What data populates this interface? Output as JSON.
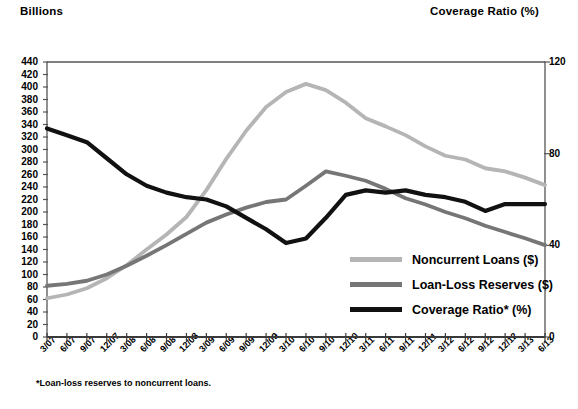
{
  "labels": {
    "left_axis_title": "Billions",
    "right_axis_title": "Coverage Ratio (%)",
    "footnote": "*Loan-loss reserves to noncurrent loans."
  },
  "legend": {
    "items": [
      {
        "label": "Noncurrent Loans ($)",
        "color": "#b5b5b5"
      },
      {
        "label": "Loan-Loss Reserves ($)",
        "color": "#767676"
      },
      {
        "label": "Coverage Ratio* (%)",
        "color": "#111111"
      }
    ]
  },
  "chart_data": {
    "type": "line",
    "title": "",
    "xlabel": "",
    "ylabel": "Billions",
    "y2label": "Coverage Ratio (%)",
    "ylim": [
      0,
      440
    ],
    "y2lim": [
      0,
      120
    ],
    "yticks": [
      0,
      20,
      40,
      60,
      80,
      100,
      120,
      140,
      160,
      180,
      200,
      220,
      240,
      260,
      280,
      300,
      320,
      340,
      360,
      380,
      400,
      420,
      440
    ],
    "y2ticks": [
      0,
      40,
      80,
      120
    ],
    "grid": false,
    "legend_position": "inside-lower-right",
    "categories": [
      "3/07",
      "6/07",
      "9/07",
      "12/07",
      "3/08",
      "6/08",
      "9/08",
      "12/08",
      "3/09",
      "6/09",
      "9/09",
      "12/09",
      "3/10",
      "6/10",
      "9/10",
      "12/10",
      "3/11",
      "6/11",
      "9/11",
      "12/11",
      "3/12",
      "6/12",
      "9/12",
      "12/12",
      "3/13",
      "6/13"
    ],
    "series": [
      {
        "name": "Noncurrent Loans ($)",
        "axis": "left",
        "color": "#b5b5b5",
        "units": "$ billions",
        "values": [
          62,
          68,
          78,
          94,
          115,
          140,
          164,
          192,
          235,
          285,
          330,
          368,
          392,
          405,
          395,
          375,
          350,
          337,
          323,
          305,
          290,
          284,
          270,
          265,
          255,
          243
        ]
      },
      {
        "name": "Loan-Loss Reserves ($)",
        "axis": "left",
        "color": "#767676",
        "units": "$ billions",
        "values": [
          82,
          85,
          90,
          100,
          114,
          130,
          147,
          165,
          183,
          196,
          207,
          216,
          220,
          242,
          265,
          258,
          250,
          237,
          222,
          212,
          200,
          190,
          178,
          168,
          158,
          147
        ]
      },
      {
        "name": "Coverage Ratio* (%)",
        "axis": "right",
        "color": "#111111",
        "units": "percent",
        "values": [
          91,
          88,
          85,
          78,
          71,
          66,
          63,
          61,
          60,
          57,
          52,
          47,
          41,
          43,
          52,
          62,
          64,
          63,
          64,
          62,
          61,
          59,
          55,
          58,
          58,
          58
        ]
      }
    ]
  }
}
